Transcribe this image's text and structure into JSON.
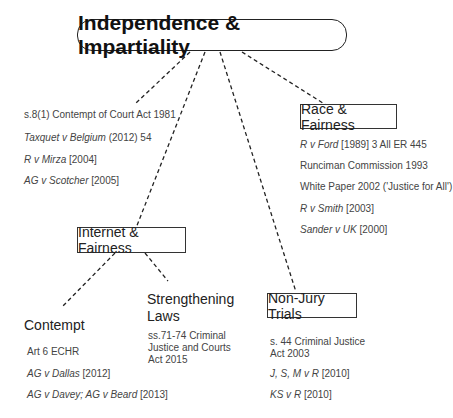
{
  "title": "Independence & Impartiality",
  "left_list": {
    "items": [
      {
        "italic": "",
        "text": "s.8(1) Contempt of Court Act 1981"
      },
      {
        "italic": "Taxquet v Belgium",
        "text": " (2012) 54"
      },
      {
        "italic": "R v Mirza",
        "text": " [2004]"
      },
      {
        "italic": "AG v Scotcher",
        "text": " [2005]"
      }
    ]
  },
  "race": {
    "label": "Race & Fairness",
    "items": [
      {
        "italic": "R v Ford",
        "text": " [1989] 3 All ER 445"
      },
      {
        "italic": "",
        "text": "Runciman Commission 1993"
      },
      {
        "italic": "",
        "text": "White Paper 2002 ('Justice for All')"
      },
      {
        "italic": "R v Smith",
        "text": " [2003]"
      },
      {
        "italic": "Sander v UK",
        "text": " [2000]"
      }
    ]
  },
  "internet": {
    "label": "Internet & Fairness"
  },
  "contempt": {
    "label": "Contempt",
    "items": [
      {
        "italic": "",
        "text": "Art 6 ECHR"
      },
      {
        "italic": "AG v Dallas",
        "text": " [2012]"
      },
      {
        "italic": "AG v Davey; AG v Beard",
        "text": " [2013]"
      }
    ]
  },
  "strengthening": {
    "label_line1": "Strengthening",
    "label_line2": "Laws",
    "text": "ss.71-74 Criminal Justice and Courts Act 2015"
  },
  "nonjury": {
    "label": "Non-Jury Trials",
    "items": [
      {
        "italic": "",
        "text": "s. 44 Criminal Justice Act 2003"
      },
      {
        "italic": "J, S, M v R",
        "text": " [2010]"
      },
      {
        "italic": "KS v R",
        "text": " [2010]"
      }
    ]
  },
  "colors": {
    "line": "#222222",
    "text": "#444444",
    "box_border": "#333333"
  }
}
